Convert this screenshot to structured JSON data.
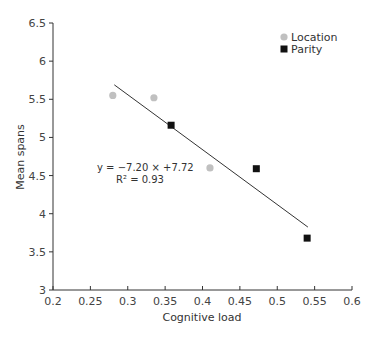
{
  "chart_data": {
    "type": "scatter",
    "title": "",
    "xlabel": "Cognitive load",
    "ylabel": "Mean spans",
    "xlim": [
      0.2,
      0.6
    ],
    "ylim": [
      3,
      6.5
    ],
    "xticks": [
      0.2,
      0.25,
      0.3,
      0.35,
      0.4,
      0.45,
      0.5,
      0.55,
      0.6
    ],
    "xtick_labels": [
      "0.2",
      "0.25",
      "0.3",
      "0.35",
      "0.4",
      "0.45",
      "0.5",
      "0.55",
      "0.6"
    ],
    "yticks": [
      3,
      3.5,
      4,
      4.5,
      5,
      5.5,
      6,
      6.5
    ],
    "ytick_labels": [
      "3",
      "3.5",
      "4",
      "4.5",
      "5",
      "5.5",
      "6",
      "6.5"
    ],
    "grid": false,
    "legend_position": "upper right",
    "series": [
      {
        "name": "Location",
        "marker": "circle",
        "color": "#c0c0c0",
        "points": [
          {
            "x": 0.28,
            "y": 5.55
          },
          {
            "x": 0.335,
            "y": 5.52
          },
          {
            "x": 0.41,
            "y": 4.6
          }
        ]
      },
      {
        "name": "Parity",
        "marker": "square",
        "color": "#111111",
        "points": [
          {
            "x": 0.358,
            "y": 5.16
          },
          {
            "x": 0.472,
            "y": 4.59
          },
          {
            "x": 0.54,
            "y": 3.68
          }
        ]
      }
    ],
    "trendline": {
      "slope": -7.2,
      "intercept": 7.72,
      "x_range": [
        0.282,
        0.541
      ],
      "equation_label": "y = −7.20 × +7.72",
      "r2_label": "R² = 0.93"
    }
  }
}
